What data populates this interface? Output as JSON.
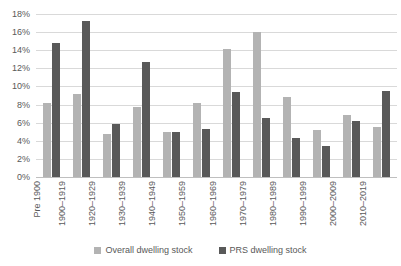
{
  "chart_data": {
    "type": "bar",
    "title": "",
    "subtitle": "",
    "xlabel": "",
    "ylabel": "",
    "ylim": [
      0,
      18
    ],
    "y_ticks": [
      "0%",
      "2%",
      "4%",
      "6%",
      "8%",
      "10%",
      "12%",
      "14%",
      "16%",
      "18%"
    ],
    "y_tick_values": [
      0,
      2,
      4,
      6,
      8,
      10,
      12,
      14,
      16,
      18
    ],
    "grid": true,
    "grid_axis": "y",
    "legend_position": "bottom",
    "value_unit": "%",
    "categories": [
      "Pre 1900",
      "1900–1919",
      "1920–1929",
      "1930–1939",
      "1940–1949",
      "1950–1959",
      "1960–1969",
      "1970–1979",
      "1980–1989",
      "1990–1999",
      "2000–2009",
      "2010–2019"
    ],
    "series": [
      {
        "name": "Overall dwelling stock",
        "color": "#b3b3b3",
        "values": [
          8.2,
          9.2,
          4.7,
          7.7,
          5.0,
          8.2,
          14.1,
          16.0,
          8.8,
          5.2,
          6.8,
          5.5
        ]
      },
      {
        "name": "PRS dwelling stock",
        "color": "#595959",
        "values": [
          14.8,
          17.2,
          5.9,
          12.7,
          5.0,
          5.3,
          9.4,
          6.5,
          4.3,
          3.4,
          6.2,
          9.5
        ]
      }
    ]
  },
  "legend": {
    "items": [
      {
        "label": "Overall dwelling stock"
      },
      {
        "label": "PRS dwelling stock"
      }
    ]
  },
  "colors": {
    "series_overall": "#b3b3b3",
    "series_prs": "#595959",
    "gridline": "#d9d9d9",
    "axis_text": "#595959",
    "background": "#ffffff"
  }
}
